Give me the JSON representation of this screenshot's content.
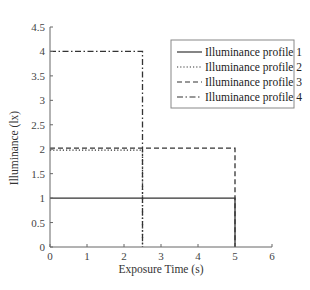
{
  "chart_data": {
    "type": "line",
    "title": "",
    "xlabel": "Exposure Time (s)",
    "ylabel": "Illuminance (lx)",
    "xlim": [
      0,
      6
    ],
    "ylim": [
      0,
      4.5
    ],
    "xticks": [
      0,
      1,
      2,
      3,
      4,
      5,
      6
    ],
    "yticks": [
      0,
      0.5,
      1,
      1.5,
      2,
      2.5,
      3,
      3.5,
      4,
      4.5
    ],
    "grid": false,
    "legend_position": "upper right",
    "series": [
      {
        "name": "Illuminance profile 1",
        "style": "solid",
        "x": [
          0,
          5,
          5
        ],
        "y": [
          1,
          1,
          0
        ]
      },
      {
        "name": "Illuminance profile 2",
        "style": "dotted",
        "x": [
          0,
          2.5,
          2.5
        ],
        "y": [
          1.98,
          1.98,
          0
        ]
      },
      {
        "name": "Illuminance profile 3",
        "style": "dashed",
        "x": [
          0,
          5,
          5
        ],
        "y": [
          2.02,
          2.02,
          0
        ]
      },
      {
        "name": "Illuminance profile 4",
        "style": "dashdot",
        "x": [
          0,
          2.5,
          2.5
        ],
        "y": [
          4,
          4,
          0
        ]
      }
    ]
  },
  "colors": {
    "line": "#333333",
    "axis": "#666666",
    "legend_border": "#888888"
  }
}
